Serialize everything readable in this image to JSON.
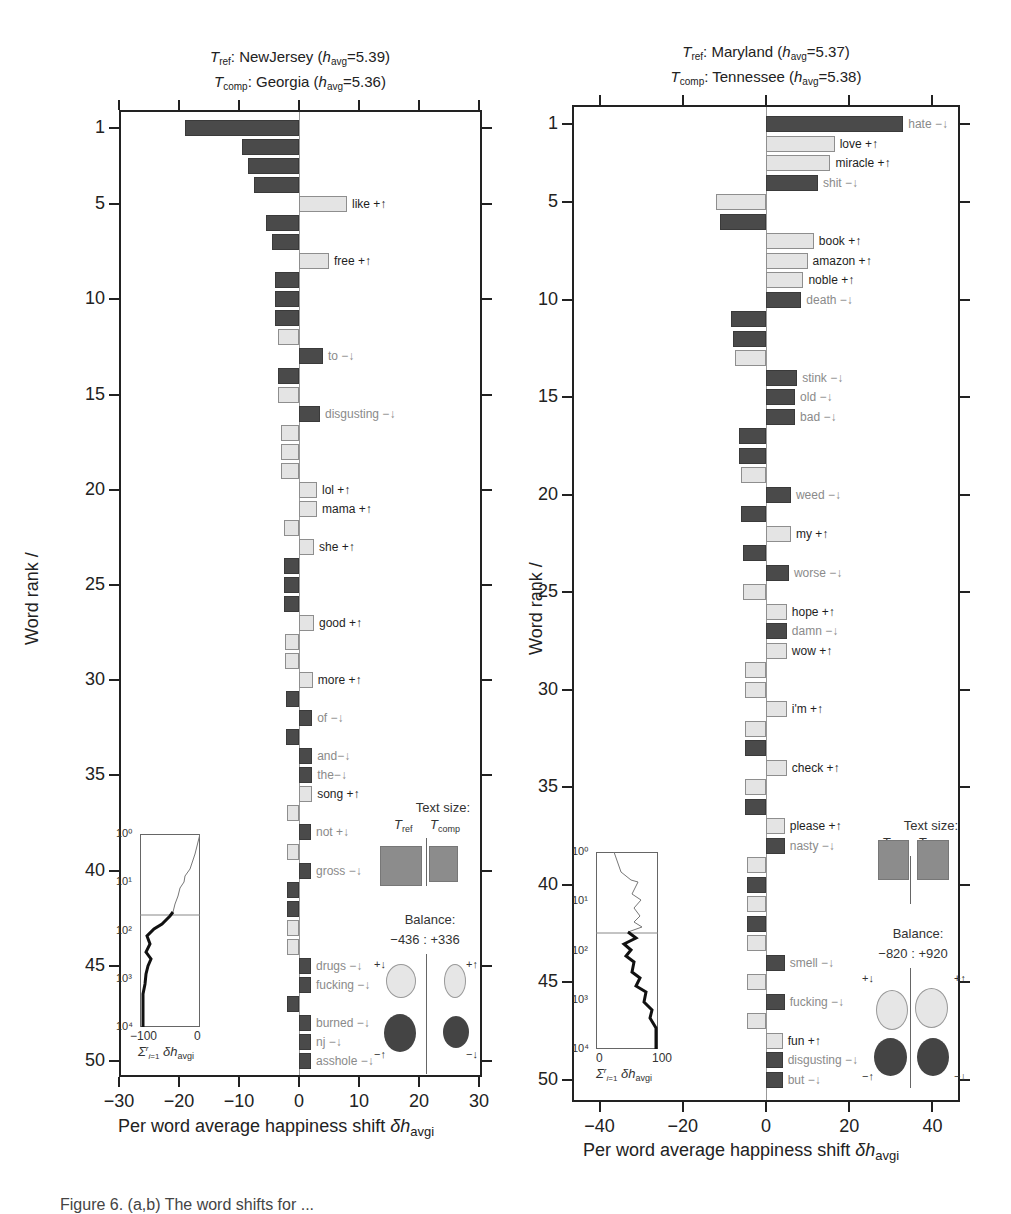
{
  "chart_data": [
    {
      "type": "bar",
      "orientation": "horizontal",
      "title_ref": "T_ref: NewJersey (h_avg = 5.39)",
      "title_comp": "T_comp: Georgia (h_avg = 5.36)",
      "ref_name": "NewJersey",
      "ref_havg": "5.39",
      "comp_name": "Georgia",
      "comp_havg": "5.36",
      "xlabel": "Per word average happiness shift δh_avgi",
      "ylabel": "Word rank /",
      "xlim": [
        -30,
        30
      ],
      "xticks": [
        "−30",
        "−20",
        "−10",
        "0",
        "10",
        "20",
        "30"
      ],
      "yticks": [
        "1",
        "5",
        "10",
        "15",
        "20",
        "25",
        "30",
        "35",
        "40",
        "45",
        "50"
      ],
      "words": [
        {
          "rank": 1,
          "label": "−↑tobacco",
          "value": -19,
          "kind": "neg",
          "tone": "light"
        },
        {
          "rank": 2,
          "label": "−↑hate",
          "value": -9.5,
          "kind": "neg",
          "tone": "light"
        },
        {
          "rank": 3,
          "label": "−↑cancer",
          "value": -8.5,
          "kind": "neg",
          "tone": "light"
        },
        {
          "rank": 4,
          "label": "−↑no",
          "value": -7.5,
          "kind": "neg",
          "tone": "light"
        },
        {
          "rank": 5,
          "label": "like +↑",
          "value": 8,
          "kind": "pos",
          "tone": "dark"
        },
        {
          "rank": 6,
          "label": "−↑nasty",
          "value": -5.5,
          "kind": "neg",
          "tone": "light"
        },
        {
          "rank": 7,
          "label": "−↑niggas",
          "value": -4.5,
          "kind": "neg",
          "tone": "light"
        },
        {
          "rank": 8,
          "label": "free +↑",
          "value": 5,
          "kind": "pos",
          "tone": "dark"
        },
        {
          "rank": 9,
          "label": "−↑ain't",
          "value": -4,
          "kind": "neg",
          "tone": "light"
        },
        {
          "rank": 10,
          "label": "−↑kill",
          "value": -4,
          "kind": "neg",
          "tone": "light"
        },
        {
          "rank": 11,
          "label": "−↑damn",
          "value": -4,
          "kind": "neg",
          "tone": "light"
        },
        {
          "rank": 12,
          "label": "+↓mom",
          "value": -3.5,
          "kind": "pos",
          "tone": "dark"
        },
        {
          "rank": 13,
          "label": "to −↓",
          "value": 4,
          "kind": "neg",
          "tone": "light"
        },
        {
          "rank": 14,
          "label": "−↑bad",
          "value": -3.5,
          "kind": "neg",
          "tone": "light"
        },
        {
          "rank": 15,
          "label": "+↓sky",
          "value": -3.5,
          "kind": "pos",
          "tone": "dark"
        },
        {
          "rank": 16,
          "label": "disgusting −↓",
          "value": 3.5,
          "kind": "neg",
          "tone": "light"
        },
        {
          "rank": 17,
          "label": "+↓coffee",
          "value": -3,
          "kind": "pos",
          "tone": "dark"
        },
        {
          "rank": 18,
          "label": "+↓i",
          "value": -3,
          "kind": "pos",
          "tone": "dark"
        },
        {
          "rank": 19,
          "label": "+↓love",
          "value": -3,
          "kind": "pos",
          "tone": "dark"
        },
        {
          "rank": 20,
          "label": "lol +↑",
          "value": 3,
          "kind": "pos",
          "tone": "dark"
        },
        {
          "rank": 21,
          "label": "mama +↑",
          "value": 3,
          "kind": "pos",
          "tone": "dark"
        },
        {
          "rank": 22,
          "label": "+↓awesome",
          "value": -2.5,
          "kind": "pos",
          "tone": "dark"
        },
        {
          "rank": 23,
          "label": "she +↑",
          "value": 2.5,
          "kind": "pos",
          "tone": "dark"
        },
        {
          "rank": 24,
          "label": "−↑ass",
          "value": -2.5,
          "kind": "neg",
          "tone": "light"
        },
        {
          "rank": 25,
          "label": "−↑can't",
          "value": -2.5,
          "kind": "neg",
          "tone": "light"
        },
        {
          "rank": 26,
          "label": "−↑banned",
          "value": -2.5,
          "kind": "neg",
          "tone": "light"
        },
        {
          "rank": 27,
          "label": "good +↑",
          "value": 2.5,
          "kind": "pos",
          "tone": "dark"
        },
        {
          "rank": 28,
          "label": "+↓kids",
          "value": -2.3,
          "kind": "pos",
          "tone": "dark"
        },
        {
          "rank": 29,
          "label": "+↓first",
          "value": -2.3,
          "kind": "pos",
          "tone": "dark"
        },
        {
          "rank": 30,
          "label": "more +↑",
          "value": 2.3,
          "kind": "pos",
          "tone": "dark"
        },
        {
          "rank": 31,
          "label": "−↑headache",
          "value": -2.2,
          "kind": "neg",
          "tone": "light"
        },
        {
          "rank": 32,
          "label": "of −↓",
          "value": 2.2,
          "kind": "neg",
          "tone": "light"
        },
        {
          "rank": 33,
          "label": "−↑gone",
          "value": -2.2,
          "kind": "neg",
          "tone": "light"
        },
        {
          "rank": 34,
          "label": "and−↓",
          "value": 2.2,
          "kind": "neg",
          "tone": "light"
        },
        {
          "rank": 35,
          "label": "the−↓",
          "value": 2.2,
          "kind": "neg",
          "tone": "light"
        },
        {
          "rank": 36,
          "label": "song +↑",
          "value": 2.2,
          "kind": "pos",
          "tone": "dark"
        },
        {
          "rank": 37,
          "label": "+↓life",
          "value": -2,
          "kind": "pos",
          "tone": "dark"
        },
        {
          "rank": 38,
          "label": "not +↓",
          "value": 2,
          "kind": "neg",
          "tone": "light"
        },
        {
          "rank": 39,
          "label": "+↓have",
          "value": -2,
          "kind": "pos",
          "tone": "dark"
        },
        {
          "rank": 40,
          "label": "gross −↓",
          "value": 2,
          "kind": "neg",
          "tone": "light"
        },
        {
          "rank": 41,
          "label": "−↑weed",
          "value": -2,
          "kind": "neg",
          "tone": "light"
        },
        {
          "rank": 42,
          "label": "−↑that",
          "value": -2,
          "kind": "neg",
          "tone": "light"
        },
        {
          "rank": 43,
          "label": "+↓night",
          "value": -2,
          "kind": "pos",
          "tone": "dark"
        },
        {
          "rank": 44,
          "label": "+↓me",
          "value": -2,
          "kind": "pos",
          "tone": "dark"
        },
        {
          "rank": 45,
          "label": "drugs −↓",
          "value": 2,
          "kind": "neg",
          "tone": "light"
        },
        {
          "rank": 46,
          "label": "fucking −↓",
          "value": 2,
          "kind": "neg",
          "tone": "light"
        },
        {
          "rank": 47,
          "label": "−↑hurt",
          "value": -2,
          "kind": "neg",
          "tone": "light"
        },
        {
          "rank": 48,
          "label": "burned −↓",
          "value": 2,
          "kind": "neg",
          "tone": "light"
        },
        {
          "rank": 49,
          "label": "nj −↓",
          "value": 2,
          "kind": "neg",
          "tone": "light"
        },
        {
          "rank": 50,
          "label": "asshole −↓",
          "value": 2,
          "kind": "neg",
          "tone": "light"
        }
      ],
      "inset": {
        "xlim": [
          -100,
          0
        ],
        "xticks": [
          "−100",
          "0"
        ],
        "yticks": [
          "10⁰",
          "10¹",
          "10²",
          "10³",
          "10⁴"
        ],
        "xlabel": "Σ_{i=1}^{r} δh_avgi",
        "horizontal_line_at_rank": 50
      },
      "legend": {
        "text_size_title": "Text size:",
        "ref_label": "T_ref",
        "comp_label": "T_comp",
        "balance_title": "Balance:",
        "balance_value": "−436 : +336",
        "balance_neg": -436,
        "balance_pos": 336,
        "plus_down": "+↓",
        "plus_up": "+↑",
        "minus_up": "−↑",
        "minus_down": "−↓"
      }
    },
    {
      "type": "bar",
      "orientation": "horizontal",
      "title_ref": "T_ref: Maryland (h_avg = 5.37)",
      "title_comp": "T_comp: Tennessee (h_avg = 5.38)",
      "ref_name": "Maryland",
      "ref_havg": "5.37",
      "comp_name": "Tennessee",
      "comp_havg": "5.38",
      "xlabel": "Per word average happiness shift δh_avgi",
      "ylabel": "Word rank /",
      "xlim": [
        -45,
        45
      ],
      "xticks": [
        "−40",
        "−20",
        "0",
        "20",
        "40"
      ],
      "yticks": [
        "1",
        "5",
        "10",
        "15",
        "20",
        "25",
        "30",
        "35",
        "40",
        "45",
        "50"
      ],
      "words": [
        {
          "rank": 1,
          "label": "hate −↓",
          "value": 33,
          "kind": "neg",
          "tone": "light"
        },
        {
          "rank": 2,
          "label": "love +↑",
          "value": 16.5,
          "kind": "pos",
          "tone": "dark"
        },
        {
          "rank": 3,
          "label": "miracle +↑",
          "value": 15.5,
          "kind": "pos",
          "tone": "dark"
        },
        {
          "rank": 4,
          "label": "shit −↓",
          "value": 12.5,
          "kind": "neg",
          "tone": "light"
        },
        {
          "rank": 5,
          "label": "+↓like",
          "value": -12,
          "kind": "pos",
          "tone": "dark"
        },
        {
          "rank": 6,
          "label": "−↑tobacco",
          "value": -11,
          "kind": "neg",
          "tone": "light"
        },
        {
          "rank": 7,
          "label": "book +↑",
          "value": 11.5,
          "kind": "pos",
          "tone": "dark"
        },
        {
          "rank": 8,
          "label": "amazon +↑",
          "value": 10,
          "kind": "pos",
          "tone": "dark"
        },
        {
          "rank": 9,
          "label": "noble +↑",
          "value": 9,
          "kind": "pos",
          "tone": "dark"
        },
        {
          "rank": 10,
          "label": "death −↓",
          "value": 8.5,
          "kind": "neg",
          "tone": "light"
        },
        {
          "rank": 11,
          "label": "−↑cancer",
          "value": -8.5,
          "kind": "neg",
          "tone": "light"
        },
        {
          "rank": 12,
          "label": "−↑ain't",
          "value": -8,
          "kind": "neg",
          "tone": "light"
        },
        {
          "rank": 13,
          "label": "+↓mom",
          "value": -7.5,
          "kind": "pos",
          "tone": "dark"
        },
        {
          "rank": 14,
          "label": "stink −↓",
          "value": 7.5,
          "kind": "neg",
          "tone": "light"
        },
        {
          "rank": 15,
          "label": "old −↓",
          "value": 7,
          "kind": "neg",
          "tone": "light"
        },
        {
          "rank": 16,
          "label": "bad −↓",
          "value": 7,
          "kind": "neg",
          "tone": "light"
        },
        {
          "rank": 17,
          "label": "−↑not",
          "value": -6.5,
          "kind": "neg",
          "tone": "light"
        },
        {
          "rank": 18,
          "label": "−↑can't",
          "value": -6.5,
          "kind": "neg",
          "tone": "light"
        },
        {
          "rank": 19,
          "label": "+↓free",
          "value": -6,
          "kind": "pos",
          "tone": "dark"
        },
        {
          "rank": 20,
          "label": "weed −↓",
          "value": 6,
          "kind": "neg",
          "tone": "light"
        },
        {
          "rank": 21,
          "label": "−↑that",
          "value": -6,
          "kind": "neg",
          "tone": "light"
        },
        {
          "rank": 22,
          "label": "my +↑",
          "value": 6,
          "kind": "pos",
          "tone": "dark"
        },
        {
          "rank": 23,
          "label": "−↑out",
          "value": -5.5,
          "kind": "neg",
          "tone": "light"
        },
        {
          "rank": 24,
          "label": "worse −↓",
          "value": 5.5,
          "kind": "neg",
          "tone": "light"
        },
        {
          "rank": 25,
          "label": "+↓weekend",
          "value": -5.5,
          "kind": "pos",
          "tone": "dark"
        },
        {
          "rank": 26,
          "label": "hope +↑",
          "value": 5,
          "kind": "pos",
          "tone": "dark"
        },
        {
          "rank": 27,
          "label": "damn −↓",
          "value": 5,
          "kind": "neg",
          "tone": "light"
        },
        {
          "rank": 28,
          "label": "wow +↑",
          "value": 5,
          "kind": "pos",
          "tone": "dark"
        },
        {
          "rank": 29,
          "label": "+↓life",
          "value": -5,
          "kind": "pos",
          "tone": "dark"
        },
        {
          "rank": 30,
          "label": "+↓i",
          "value": -5,
          "kind": "pos",
          "tone": "dark"
        },
        {
          "rank": 31,
          "label": "i'm +↑",
          "value": 5,
          "kind": "pos",
          "tone": "dark"
        },
        {
          "rank": 32,
          "label": "+↓me",
          "value": -5,
          "kind": "pos",
          "tone": "dark"
        },
        {
          "rank": 33,
          "label": "−↑haven't",
          "value": -5,
          "kind": "neg",
          "tone": "light"
        },
        {
          "rank": 34,
          "label": "check +↑",
          "value": 5,
          "kind": "pos",
          "tone": "dark"
        },
        {
          "rank": 35,
          "label": "+↓money",
          "value": -5,
          "kind": "pos",
          "tone": "dark"
        },
        {
          "rank": 36,
          "label": "−↑shot",
          "value": -5,
          "kind": "neg",
          "tone": "light"
        },
        {
          "rank": 37,
          "label": "please +↑",
          "value": 4.5,
          "kind": "pos",
          "tone": "dark"
        },
        {
          "rank": 38,
          "label": "nasty −↓",
          "value": 4.5,
          "kind": "neg",
          "tone": "light"
        },
        {
          "rank": 39,
          "label": "+↓kids",
          "value": -4.5,
          "kind": "pos",
          "tone": "dark"
        },
        {
          "rank": 40,
          "label": "−↑burning",
          "value": -4.5,
          "kind": "neg",
          "tone": "light"
        },
        {
          "rank": 41,
          "label": "+↓buy",
          "value": -4.5,
          "kind": "pos",
          "tone": "dark"
        },
        {
          "rank": 42,
          "label": "−↑sick",
          "value": -4.5,
          "kind": "neg",
          "tone": "light"
        },
        {
          "rank": 43,
          "label": "+↓lol",
          "value": -4.5,
          "kind": "pos",
          "tone": "dark"
        },
        {
          "rank": 44,
          "label": "smell −↓",
          "value": 4.5,
          "kind": "neg",
          "tone": "light"
        },
        {
          "rank": 45,
          "label": "+↓enjoying",
          "value": -4.5,
          "kind": "pos",
          "tone": "dark"
        },
        {
          "rank": 46,
          "label": "fucking −↓",
          "value": 4.5,
          "kind": "neg",
          "tone": "light"
        },
        {
          "rank": 47,
          "label": "+↓god",
          "value": -4.5,
          "kind": "pos",
          "tone": "dark"
        },
        {
          "rank": 48,
          "label": "fun +↑",
          "value": 4,
          "kind": "pos",
          "tone": "dark"
        },
        {
          "rank": 49,
          "label": "disgusting −↓",
          "value": 4,
          "kind": "neg",
          "tone": "light"
        },
        {
          "rank": 50,
          "label": "but −↓",
          "value": 4,
          "kind": "neg",
          "tone": "light"
        }
      ],
      "inset": {
        "xlim": [
          0,
          100
        ],
        "xticks": [
          "0",
          "100"
        ],
        "yticks": [
          "10⁰",
          "10¹",
          "10²",
          "10³",
          "10⁴"
        ],
        "xlabel": "Σ_{i=1}^{r} δh_avgi",
        "horizontal_line_at_rank": 50
      },
      "legend": {
        "text_size_title": "Text size:",
        "ref_label": "T_ref",
        "comp_label": "T_comp",
        "balance_title": "Balance:",
        "balance_value": "−820 : +920",
        "balance_neg": -820,
        "balance_pos": 920,
        "plus_down": "+↓",
        "plus_up": "+↑",
        "minus_up": "−↑",
        "minus_down": "−↓"
      }
    }
  ],
  "text": {
    "left_title_ref_name": "NewJersey",
    "left_title_ref_val": "5.39",
    "left_title_comp_name": "Georgia",
    "left_title_comp_val": "5.36",
    "right_title_ref_name": "Maryland",
    "right_title_ref_val": "5.37",
    "right_title_comp_name": "Tennessee",
    "right_title_comp_val": "5.38",
    "xlabel_main": "Per word average happiness shift ",
    "xlabel_delta": "δh",
    "xlabel_sub": "avgi",
    "ylabel": "Word rank /",
    "inset_xlabel_sigma": "Σ",
    "inset_xlabel_rest": "δh",
    "inset_xlabel_sub": "avgi",
    "caption_fragment": "Figure 6. (a,b) The word shifts for ..."
  }
}
